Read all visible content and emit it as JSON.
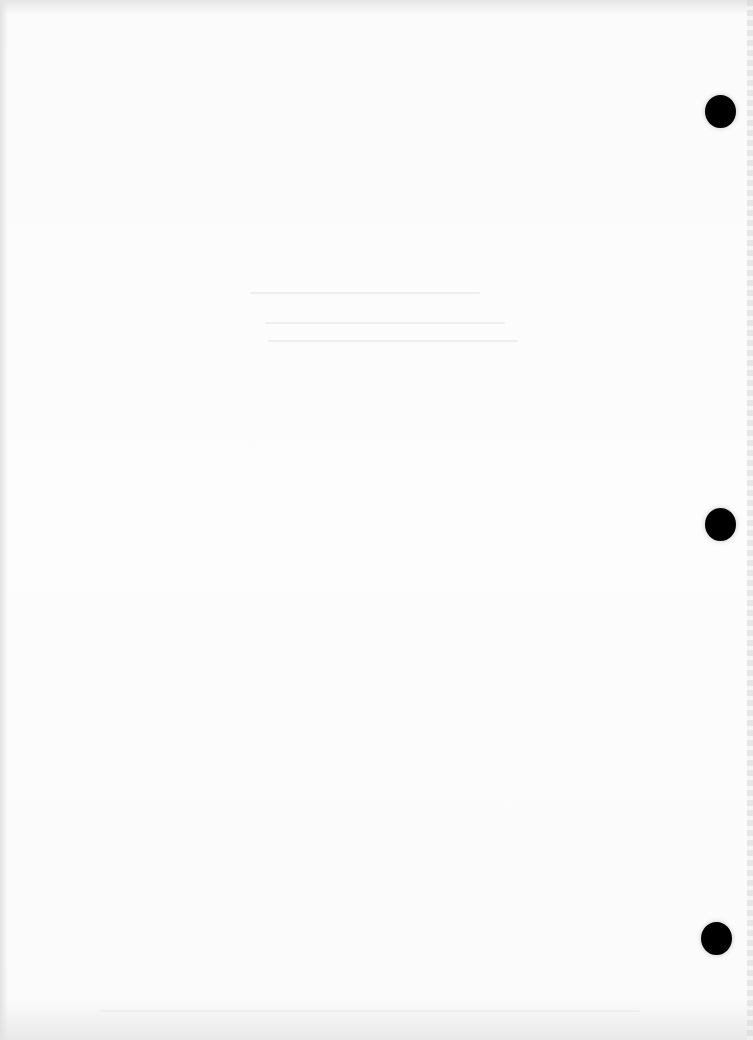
{
  "document": {
    "type": "scanned blank page",
    "content_text": "",
    "binder_holes": [
      {
        "name": "top",
        "x": 705,
        "y": 95
      },
      {
        "name": "middle",
        "x": 705,
        "y": 508
      },
      {
        "name": "bottom",
        "x": 701,
        "y": 922
      }
    ]
  }
}
